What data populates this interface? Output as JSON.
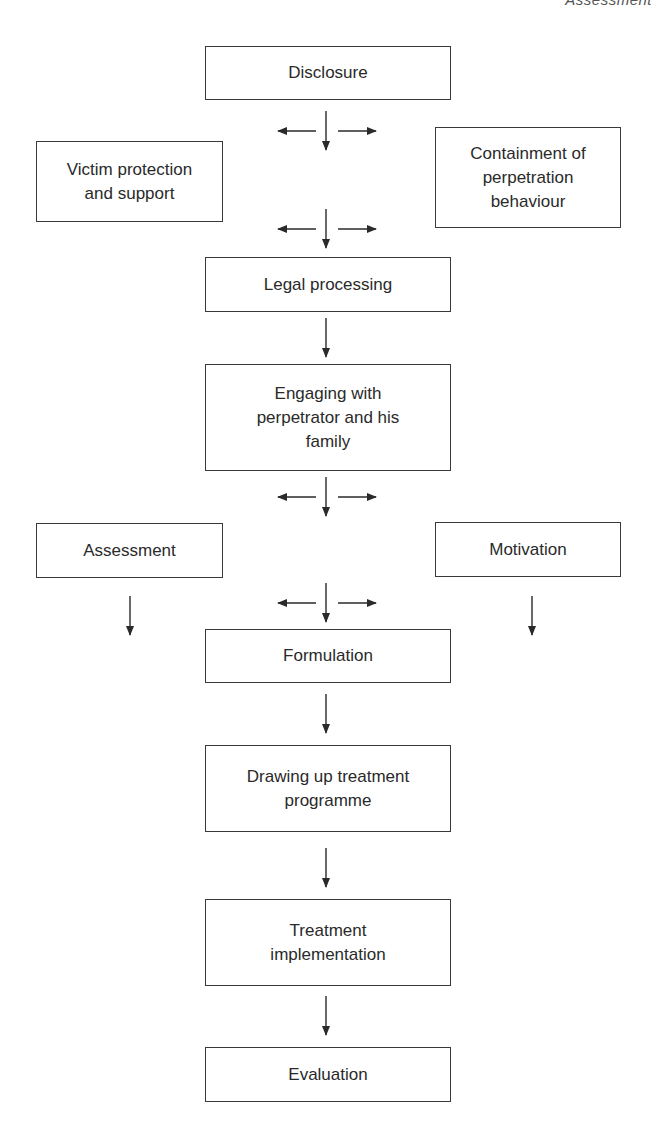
{
  "header": {
    "running_title": "Assessment"
  },
  "diagram": {
    "type": "flowchart",
    "nodes": {
      "disclosure": "Disclosure",
      "victim": "Victim protection\nand support",
      "containment": "Containment of\nperpetration\nbehaviour",
      "legal": "Legal processing",
      "engaging": "Engaging with\nperpetrator and his\nfamily",
      "assessment": "Assessment",
      "motivation": "Motivation",
      "formulation": "Formulation",
      "drawing": "Drawing up treatment\nprogramme",
      "treatment": "Treatment\nimplementation",
      "evaluation": "Evaluation"
    },
    "edges": [
      [
        "Disclosure",
        "Victim protection and support"
      ],
      [
        "Disclosure",
        "Containment of perpetration behaviour"
      ],
      [
        "Disclosure",
        "Legal processing"
      ],
      [
        "Legal processing",
        "Engaging with perpetrator and his family"
      ],
      [
        "Engaging with perpetrator and his family",
        "Assessment"
      ],
      [
        "Engaging with perpetrator and his family",
        "Motivation"
      ],
      [
        "Engaging with perpetrator and his family",
        "Formulation"
      ],
      [
        "Assessment",
        "Formulation"
      ],
      [
        "Motivation",
        "Formulation"
      ],
      [
        "Formulation",
        "Drawing up treatment programme"
      ],
      [
        "Drawing up treatment programme",
        "Treatment implementation"
      ],
      [
        "Treatment implementation",
        "Evaluation"
      ]
    ]
  }
}
